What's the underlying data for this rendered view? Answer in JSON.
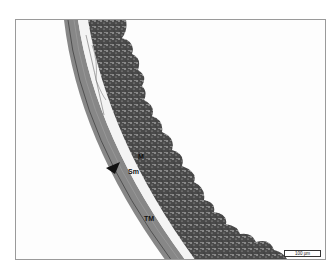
{
  "figure": {
    "type": "histological micrograph",
    "labels": {
      "mucosa": "M",
      "submucosa": "Sm",
      "tunica_muscularis": "TM"
    },
    "scale_bar": "100 µm",
    "arrowhead": "arrowhead-marker",
    "colors": {
      "background": "#fdfdfd",
      "frame_border": "#9a9a9a",
      "muscle_layer": "#6e6e6e",
      "mucosa_dark": "#3a3a3a",
      "mucosa_light": "#8a8a8a"
    }
  }
}
